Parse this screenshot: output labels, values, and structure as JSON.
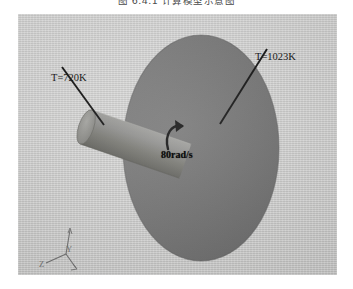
{
  "caption": {
    "text": "图 6.4.1   计算模型示意图"
  },
  "viewport": {
    "background_color": "#d3d3d2",
    "disc_color": "#6f6f6f",
    "cylinder_color": "#7a7a78"
  },
  "annotations": {
    "hot_surface_label": "T=1023K",
    "cylinder_label": "T=720K",
    "rotation_label": "80rad/s"
  },
  "axis_triad": {
    "z_label": "Z",
    "y_label": "Y",
    "x_label": "X",
    "color": "#6e6e6e"
  }
}
